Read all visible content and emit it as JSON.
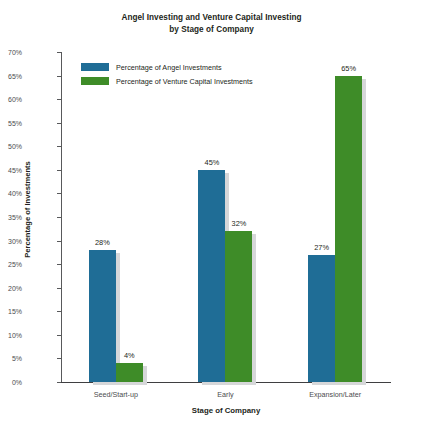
{
  "chart_data": {
    "type": "bar",
    "title": "Angel Investing and Venture Capital Investing by Stage of Company",
    "title_line1": "Angel Investing and Venture Capital Investing",
    "title_line2": "by Stage of Company",
    "xlabel": "Stage of Company",
    "ylabel": "Percentage of Investments",
    "categories": [
      "Seed/Start-up",
      "Early",
      "Expansion/Later"
    ],
    "series": [
      {
        "name": "Percentage of Angel Investments",
        "color": "#1f6d96",
        "values": [
          28,
          45,
          27
        ],
        "labels": [
          "28%",
          "45%",
          "27%"
        ]
      },
      {
        "name": "Percentage of Venture Capital Investments",
        "color": "#3e8c28",
        "values": [
          4,
          32,
          65
        ],
        "labels": [
          "4%",
          "32%",
          "65%"
        ]
      }
    ],
    "ylim": [
      0,
      70
    ],
    "ytick_step": 5,
    "yticks": [
      70,
      65,
      60,
      55,
      50,
      45,
      40,
      35,
      30,
      25,
      20,
      15,
      10,
      5,
      0
    ],
    "ytick_labels": [
      "70%",
      "65%",
      "60%",
      "55%",
      "50%",
      "45%",
      "40%",
      "35%",
      "30%",
      "25%",
      "20%",
      "15%",
      "10%",
      "5%",
      "0%"
    ],
    "grid": false,
    "legend_position": "top-left-inside",
    "shadow_color": "#d6d7d9",
    "axis_color": "#58595b",
    "text_color": "#231f20"
  }
}
